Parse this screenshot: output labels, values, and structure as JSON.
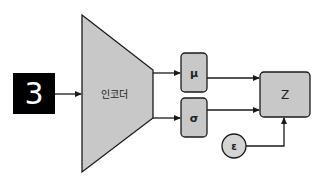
{
  "diagram": {
    "title": "",
    "colors": {
      "background": "#ffffff",
      "shape_fill": "#c8c8c8",
      "stroke": "#1a1a1a",
      "input_bg": "#000000",
      "input_digit": "#ffffff"
    },
    "nodes": {
      "input": {
        "label": "3",
        "type": "image",
        "description": "MNIST digit image"
      },
      "encoder": {
        "label": "인코더",
        "type": "trapezoid"
      },
      "mu": {
        "label": "μ",
        "type": "rounded-box"
      },
      "sigma": {
        "label": "σ",
        "type": "rounded-box"
      },
      "z": {
        "label": "Z",
        "type": "rounded-box"
      },
      "epsilon": {
        "label": "ε",
        "type": "circle"
      }
    },
    "edges": [
      {
        "from": "input",
        "to": "encoder"
      },
      {
        "from": "encoder",
        "to": "mu"
      },
      {
        "from": "encoder",
        "to": "sigma"
      },
      {
        "from": "mu",
        "to": "z"
      },
      {
        "from": "sigma",
        "to": "z"
      },
      {
        "from": "epsilon",
        "to": "z"
      }
    ]
  }
}
